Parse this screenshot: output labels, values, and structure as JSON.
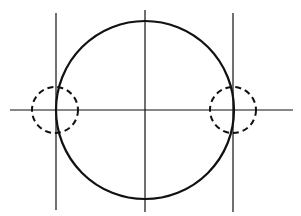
{
  "diagram": {
    "width": 301,
    "height": 216,
    "stroke_color": "#111111",
    "background": "#ffffff",
    "main_circle": {
      "cx": 145,
      "cy": 110,
      "r": 89,
      "stroke_width": 2.2
    },
    "horizontal_axis": {
      "x1": 10,
      "y1": 110,
      "x2": 293,
      "y2": 110
    },
    "vertical_axis": {
      "x1": 145,
      "y1": 10,
      "x2": 145,
      "y2": 212
    },
    "left_tangent_line": {
      "x1": 56,
      "y1": 13,
      "x2": 56,
      "y2": 210
    },
    "right_tangent_line": {
      "x1": 233,
      "y1": 13,
      "x2": 233,
      "y2": 212
    },
    "left_dashed_circle": {
      "cx": 55,
      "cy": 110,
      "r": 23
    },
    "right_dashed_circle": {
      "cx": 233,
      "cy": 110,
      "r": 23
    }
  }
}
